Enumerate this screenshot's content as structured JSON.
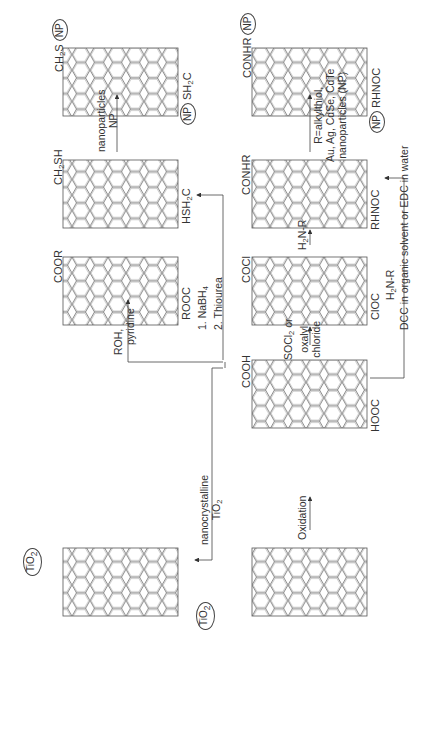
{
  "diagram": {
    "orientation": "rotated -90deg",
    "nodes": [
      {
        "id": "cnt-tio2",
        "label_top": "TiO2",
        "label_bottom": "TiO2",
        "desc": "CNT decorated with TiO2"
      },
      {
        "id": "cnt-cooh",
        "label_top": "COOH",
        "label_bottom": "HOOC",
        "desc": "Carboxylated CNT"
      },
      {
        "id": "cnt-pristine",
        "desc": "Pristine CNT"
      },
      {
        "id": "cnt-coor",
        "label_top": "COOR",
        "label_bottom": "ROOC",
        "desc": "Esterified CNT"
      },
      {
        "id": "cnt-cocl",
        "label_top": "COCl",
        "label_bottom": "ClOC",
        "desc": "Acyl chloride CNT"
      },
      {
        "id": "cnt-ch2sh",
        "label_top": "CH2SH",
        "label_bottom": "HSH2C",
        "desc": "Thiolated CNT"
      },
      {
        "id": "cnt-conhr",
        "label_top": "CONHR",
        "label_bottom": "RHNOC",
        "desc": "Amidated CNT"
      },
      {
        "id": "cnt-ch2s-np",
        "label_top": "CH2S",
        "label_top_circle": "NP",
        "label_bottom": "SH2C",
        "label_bottom_circle": "NP",
        "desc": "Thiol-NP conjugate"
      },
      {
        "id": "cnt-conhr-np",
        "label_top": "CONHR",
        "label_top_circle": "NP",
        "label_bottom": "RHNOC",
        "label_bottom_circle": "NP",
        "desc": "Amide-NP conjugate"
      }
    ],
    "conditions": {
      "oxidation": "Oxidation",
      "tio2_line1": "nanocrystalline",
      "tio2_line2": "TiO2",
      "roh_line1": "ROH,",
      "roh_line2": "pyridine",
      "nabh4_line1": "1. NaBH4",
      "nabh4_line2": "2. Thiourea",
      "socl2_line1": "SOCl2 or",
      "socl2_line2": "oxalyl",
      "socl2_line3": "chloride",
      "h2nr": "H2N-R",
      "dcc_line1": "H2N-R",
      "dcc_line2": "DCC in organic solvent or EDC in water",
      "np_line1": "nanoparticles",
      "np_line2": "NP",
      "alkyl_line1": "R=alkylthiol,",
      "alkyl_line2": "Au, Ag, CdSe, CdTe",
      "alkyl_line3": "nanoparticles (NP)"
    },
    "labels": {
      "tio2": "TiO",
      "sub2": "2",
      "cooh": "COOH",
      "hooc": "HOOC",
      "coor": "COOR",
      "rooc": "ROOC",
      "cocl": "COCl",
      "cloc": "ClOC",
      "ch2sh_a": "CH",
      "ch2sh_b": "SH",
      "hsh2c_a": "HSH",
      "hsh2c_b": "C",
      "conhr": "CONHR",
      "rhnoc": "RHNOC",
      "ch2s_a": "CH",
      "ch2s_b": "S",
      "sh2c_a": "SH",
      "sh2c_b": "C",
      "np": "NP",
      "nabh4_a": "1. NaBH",
      "nabh4_b": "4",
      "thiourea": "2. Thiourea",
      "socl_a": "SOCl",
      "socl_b": " or",
      "oxalyl": "oxalyl",
      "chloride": "chloride",
      "h2nr_a": "H",
      "h2nr_b": "N-R",
      "nanocrystalline": "nanocrystalline",
      "roh": "ROH,",
      "pyridine": "pyridine",
      "oxidation": "Oxidation",
      "nanoparticles": "nanoparticles",
      "dcc": "DCC in organic solvent or EDC in water",
      "alkyl1": "R=alkylthiol,",
      "alkyl2": "Au, Ag, CdSe, CdTe",
      "alkyl3": "nanoparticles (NP)"
    }
  }
}
